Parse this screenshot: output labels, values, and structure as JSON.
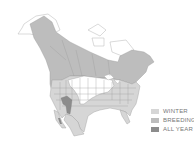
{
  "map": {
    "region": "North America",
    "colors": {
      "winter": "#d6d6d6",
      "breeding": "#bdbdbd",
      "all_year": "#8c8c8c",
      "none": "#ffffff",
      "border": "#9a9a9a"
    }
  },
  "legend": {
    "items": [
      {
        "label": "WINTER",
        "color": "#d6d6d6"
      },
      {
        "label": "BREEDING",
        "color": "#bdbdbd"
      },
      {
        "label": "ALL YEAR",
        "color": "#8c8c8c"
      }
    ]
  }
}
